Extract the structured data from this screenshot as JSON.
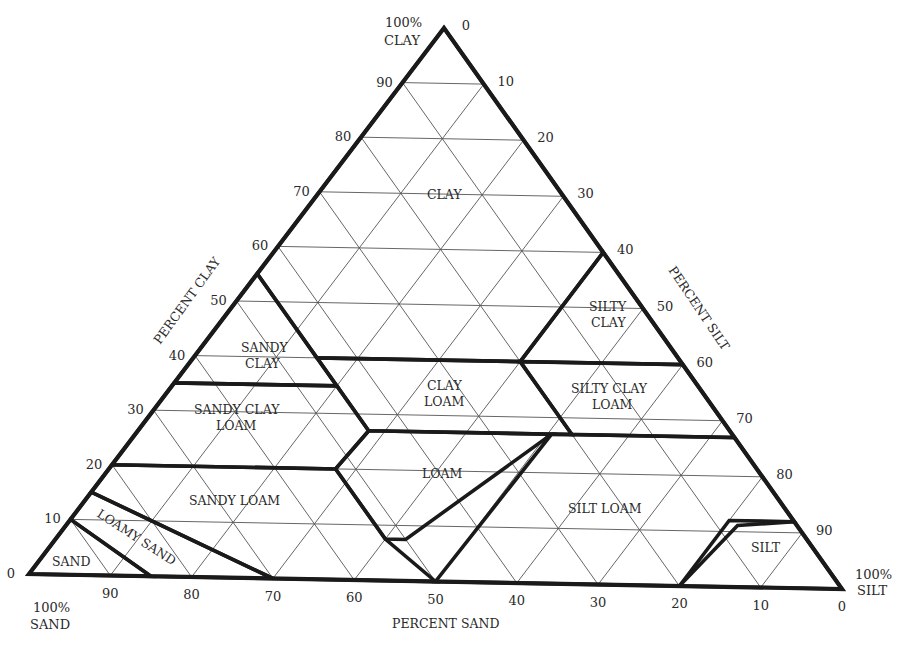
{
  "chart_data": {
    "type": "ternary",
    "axes": {
      "clay": {
        "label": "PERCENT CLAY",
        "vertex_label": "100% CLAY",
        "ticks": [
          0,
          10,
          20,
          30,
          40,
          50,
          60,
          70,
          80,
          90
        ]
      },
      "silt": {
        "label": "PERCENT SILT",
        "vertex_label": "100% SILT",
        "ticks": [
          0,
          10,
          20,
          30,
          40,
          50,
          60,
          70,
          80,
          90
        ]
      },
      "sand": {
        "label": "PERCENT SAND",
        "vertex_label": "100% SAND",
        "ticks": [
          0,
          10,
          20,
          30,
          40,
          50,
          60,
          70,
          80,
          90
        ]
      }
    },
    "grid": true,
    "grid_step": 10,
    "regions": [
      {
        "name": "CLAY",
        "label_lines": [
          "CLAY"
        ],
        "polygon_sand_clay_silt": [
          [
            45,
            55,
            0
          ],
          [
            0,
            100,
            0
          ],
          [
            0,
            60,
            40
          ],
          [
            20,
            40,
            40
          ],
          [
            45,
            40,
            15
          ]
        ]
      },
      {
        "name": "SILTY CLAY",
        "label_lines": [
          "SILTY",
          "CLAY"
        ],
        "polygon_sand_clay_silt": [
          [
            0,
            60,
            40
          ],
          [
            0,
            40,
            60
          ],
          [
            20,
            40,
            40
          ]
        ]
      },
      {
        "name": "SANDY CLAY",
        "label_lines": [
          "SANDY",
          "CLAY"
        ],
        "polygon_sand_clay_silt": [
          [
            45,
            55,
            0
          ],
          [
            65,
            35,
            0
          ],
          [
            45,
            35,
            20
          ]
        ]
      },
      {
        "name": "CLAY LOAM",
        "label_lines": [
          "CLAY",
          "LOAM"
        ],
        "polygon_sand_clay_silt": [
          [
            45,
            40,
            15
          ],
          [
            20,
            40,
            40
          ],
          [
            20,
            27,
            53
          ],
          [
            45,
            27,
            28
          ]
        ]
      },
      {
        "name": "SILTY CLAY LOAM",
        "label_lines": [
          "SILTY CLAY",
          "LOAM"
        ],
        "polygon_sand_clay_silt": [
          [
            20,
            40,
            40
          ],
          [
            0,
            40,
            60
          ],
          [
            0,
            27,
            73
          ],
          [
            20,
            27,
            53
          ]
        ]
      },
      {
        "name": "SANDY CLAY LOAM",
        "label_lines": [
          "SANDY CLAY",
          "LOAM"
        ],
        "polygon_sand_clay_silt": [
          [
            65,
            35,
            0
          ],
          [
            80,
            20,
            0
          ],
          [
            52.5,
            20,
            27.5
          ],
          [
            45,
            27,
            28
          ],
          [
            45,
            35,
            20
          ]
        ]
      },
      {
        "name": "LOAM",
        "label_lines": [
          "LOAM"
        ],
        "polygon_sand_clay_silt": [
          [
            45,
            27,
            28
          ],
          [
            22.5,
            27,
            50.5
          ],
          [
            50,
            7.5,
            42.5
          ],
          [
            52.5,
            7.5,
            40
          ],
          [
            52.5,
            20,
            27.5
          ]
        ]
      },
      {
        "name": "SILT LOAM",
        "label_lines": [
          "SILT LOAM"
        ],
        "polygon_sand_clay_silt": [
          [
            22.5,
            27,
            50.5
          ],
          [
            0,
            27,
            73
          ],
          [
            0,
            12,
            88
          ],
          [
            8,
            12,
            80
          ],
          [
            20,
            0,
            80
          ],
          [
            50,
            0,
            50
          ]
        ]
      },
      {
        "name": "SILT",
        "label_lines": [
          "SILT"
        ],
        "polygon_sand_clay_silt": [
          [
            20,
            0,
            80
          ],
          [
            8,
            12,
            88
          ],
          [
            0,
            12,
            88
          ],
          [
            0,
            0,
            100
          ]
        ]
      },
      {
        "name": "SANDY LOAM",
        "label_lines": [
          "SANDY LOAM"
        ],
        "polygon_sand_clay_silt": [
          [
            80,
            20,
            0
          ],
          [
            52.5,
            20,
            27.5
          ],
          [
            52.5,
            7.5,
            40
          ],
          [
            50,
            0,
            50
          ],
          [
            70,
            0,
            30
          ],
          [
            85,
            15,
            0
          ]
        ]
      },
      {
        "name": "LOAMY SAND",
        "label_lines": [
          "LOAMY SAND"
        ],
        "polygon_sand_clay_silt": [
          [
            85,
            15,
            0
          ],
          [
            70,
            0,
            30
          ],
          [
            85,
            0,
            15
          ],
          [
            90,
            10,
            0
          ]
        ]
      },
      {
        "name": "SAND",
        "label_lines": [
          "SAND"
        ],
        "polygon_sand_clay_silt": [
          [
            90,
            10,
            0
          ],
          [
            85,
            0,
            15
          ],
          [
            100,
            0,
            0
          ]
        ]
      }
    ]
  },
  "labels": {
    "vertex_clay_1": "100%",
    "vertex_clay_2": "CLAY",
    "vertex_sand_1": "100%",
    "vertex_sand_2": "SAND",
    "vertex_silt_1": "100%",
    "vertex_silt_2": "SILT",
    "axis_clay": "PERCENT CLAY",
    "axis_silt": "PERCENT SILT",
    "axis_sand": "PERCENT SAND",
    "clay_ticks": [
      "0",
      "10",
      "20",
      "30",
      "40",
      "50",
      "60",
      "70",
      "80",
      "90"
    ],
    "silt_ticks": [
      "0",
      "10",
      "20",
      "30",
      "40",
      "50",
      "60",
      "70",
      "80",
      "90"
    ],
    "sand_ticks": [
      "90",
      "80",
      "70",
      "60",
      "50",
      "40",
      "30",
      "20",
      "10",
      "0"
    ],
    "regions": {
      "clay": "CLAY",
      "silty_clay_1": "SILTY",
      "silty_clay_2": "CLAY",
      "sandy_clay_1": "SANDY",
      "sandy_clay_2": "CLAY",
      "clay_loam_1": "CLAY",
      "clay_loam_2": "LOAM",
      "silty_clay_loam_1": "SILTY CLAY",
      "silty_clay_loam_2": "LOAM",
      "sandy_clay_loam_1": "SANDY CLAY",
      "sandy_clay_loam_2": "LOAM",
      "loam": "LOAM",
      "silt_loam": "SILT LOAM",
      "silt": "SILT",
      "sandy_loam": "SANDY LOAM",
      "loamy_sand": "LOAMY SAND",
      "sand": "SAND"
    }
  }
}
